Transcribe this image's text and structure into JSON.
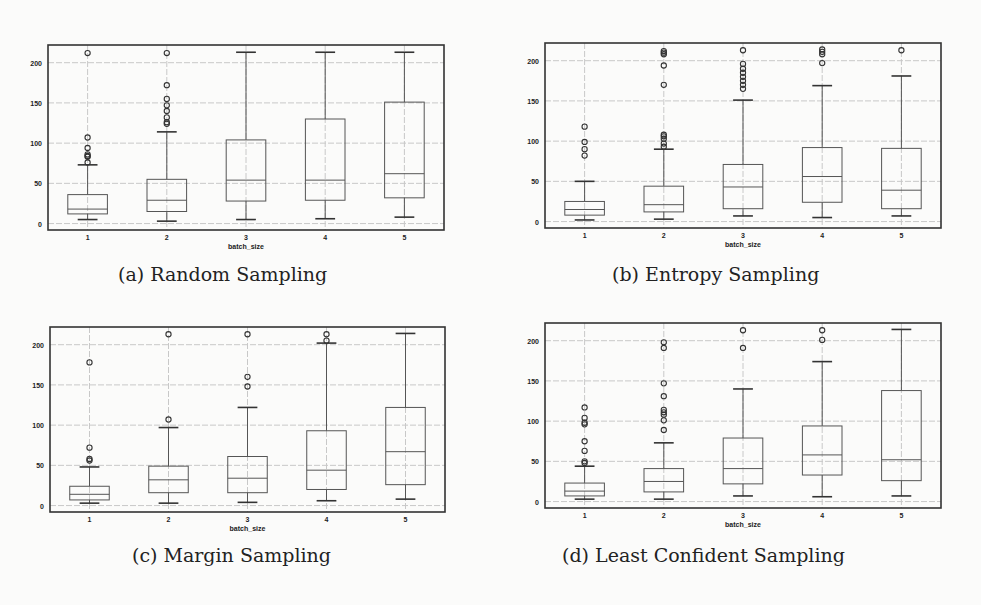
{
  "figure": {
    "captions": [
      "(a) Random Sampling",
      "(b) Entropy Sampling",
      "(c) Margin Sampling",
      "(d) Least Confident Sampling"
    ]
  },
  "style": {
    "frame_color": "#333333",
    "box_color": "#555555",
    "grid_color": "#c8c8c8",
    "background": "#fbfbfa"
  },
  "chart_data": [
    {
      "type": "box",
      "title": "(a) Random Sampling",
      "xlabel": "batch_size",
      "ylabel": "",
      "categories": [
        "1",
        "2",
        "3",
        "4",
        "5"
      ],
      "yticks": [
        0,
        50,
        100,
        150,
        200
      ],
      "ylim": [
        -8,
        222
      ],
      "grid": true,
      "boxes": [
        {
          "whislo": 5,
          "q1": 12,
          "med": 18,
          "q3": 36,
          "whishi": 73,
          "fliers": [
            76,
            83,
            84,
            86,
            94,
            107,
            212
          ]
        },
        {
          "whislo": 3,
          "q1": 15,
          "med": 29,
          "q3": 55,
          "whishi": 114,
          "fliers": [
            124,
            126,
            132,
            140,
            147,
            155,
            172,
            212
          ]
        },
        {
          "whislo": 5,
          "q1": 28,
          "med": 54,
          "q3": 104,
          "whishi": 213,
          "fliers": []
        },
        {
          "whislo": 6,
          "q1": 29,
          "med": 54,
          "q3": 130,
          "whishi": 213,
          "fliers": []
        },
        {
          "whislo": 8,
          "q1": 32,
          "med": 62,
          "q3": 151,
          "whishi": 213,
          "fliers": []
        }
      ]
    },
    {
      "type": "box",
      "title": "(b) Entropy Sampling",
      "xlabel": "batch_size",
      "ylabel": "",
      "categories": [
        "1",
        "2",
        "3",
        "4",
        "5"
      ],
      "yticks": [
        0,
        50,
        100,
        150,
        200
      ],
      "ylim": [
        -8,
        222
      ],
      "grid": true,
      "boxes": [
        {
          "whislo": 2,
          "q1": 8,
          "med": 15,
          "q3": 25,
          "whishi": 50,
          "fliers": [
            82,
            90,
            99,
            118
          ]
        },
        {
          "whislo": 3,
          "q1": 12,
          "med": 21,
          "q3": 44,
          "whishi": 90,
          "fliers": [
            93,
            97,
            103,
            106,
            108,
            170,
            194,
            208,
            210,
            212
          ]
        },
        {
          "whislo": 7,
          "q1": 16,
          "med": 43,
          "q3": 71,
          "whishi": 151,
          "fliers": [
            165,
            170,
            175,
            180,
            185,
            190,
            196,
            213
          ]
        },
        {
          "whislo": 5,
          "q1": 24,
          "med": 56,
          "q3": 92,
          "whishi": 169,
          "fliers": [
            197,
            208,
            211,
            214
          ]
        },
        {
          "whislo": 7,
          "q1": 16,
          "med": 39,
          "q3": 91,
          "whishi": 181,
          "fliers": [
            213
          ]
        }
      ]
    },
    {
      "type": "box",
      "title": "(c) Margin Sampling",
      "xlabel": "batch_size",
      "ylabel": "",
      "categories": [
        "1",
        "2",
        "3",
        "4",
        "5"
      ],
      "yticks": [
        0,
        50,
        100,
        150,
        200
      ],
      "ylim": [
        -8,
        222
      ],
      "grid": true,
      "boxes": [
        {
          "whislo": 3,
          "q1": 7,
          "med": 14,
          "q3": 24,
          "whishi": 48,
          "fliers": [
            56,
            58,
            72,
            178
          ]
        },
        {
          "whislo": 3,
          "q1": 16,
          "med": 32,
          "q3": 49,
          "whishi": 97,
          "fliers": [
            107,
            213
          ]
        },
        {
          "whislo": 4,
          "q1": 16,
          "med": 34,
          "q3": 61,
          "whishi": 122,
          "fliers": [
            148,
            160,
            213
          ]
        },
        {
          "whislo": 6,
          "q1": 20,
          "med": 44,
          "q3": 93,
          "whishi": 202,
          "fliers": [
            205,
            213
          ]
        },
        {
          "whislo": 8,
          "q1": 26,
          "med": 67,
          "q3": 122,
          "whishi": 214,
          "fliers": []
        }
      ]
    },
    {
      "type": "box",
      "title": "(d) Least Confident Sampling",
      "xlabel": "batch_size",
      "ylabel": "",
      "categories": [
        "1",
        "2",
        "3",
        "4",
        "5"
      ],
      "yticks": [
        0,
        50,
        100,
        150,
        200
      ],
      "ylim": [
        -8,
        222
      ],
      "grid": true,
      "boxes": [
        {
          "whislo": 3,
          "q1": 7,
          "med": 13,
          "q3": 23,
          "whishi": 44,
          "fliers": [
            48,
            50,
            63,
            75,
            96,
            98,
            104,
            117
          ]
        },
        {
          "whislo": 3,
          "q1": 12,
          "med": 25,
          "q3": 41,
          "whishi": 73,
          "fliers": [
            89,
            101,
            108,
            111,
            114,
            131,
            147,
            191,
            198
          ]
        },
        {
          "whislo": 7,
          "q1": 22,
          "med": 41,
          "q3": 79,
          "whishi": 140,
          "fliers": [
            191,
            213
          ]
        },
        {
          "whislo": 6,
          "q1": 33,
          "med": 58,
          "q3": 94,
          "whishi": 174,
          "fliers": [
            201,
            213
          ]
        },
        {
          "whislo": 7,
          "q1": 26,
          "med": 52,
          "q3": 138,
          "whishi": 214,
          "fliers": []
        }
      ]
    }
  ]
}
